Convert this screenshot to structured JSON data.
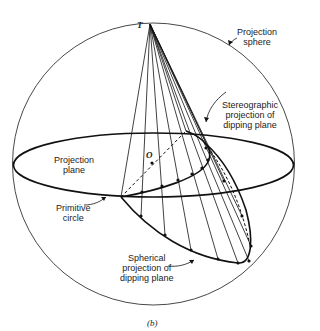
{
  "diagram": {
    "caption": "(b)",
    "points": {
      "top_point": "T",
      "center_point": "O"
    },
    "labels": {
      "projection_sphere": [
        "Projection",
        "sphere"
      ],
      "stereographic_projection": [
        "Stereographic",
        "projection of",
        "dipping plane"
      ],
      "projection_plane": [
        "Projection",
        "plane"
      ],
      "primitive_circle": [
        "Primitive",
        "circle"
      ],
      "spherical_projection": [
        "Spherical",
        "projection of",
        "dipping plane"
      ]
    },
    "colors": {
      "line": "#111111",
      "background": "#ffffff"
    }
  }
}
